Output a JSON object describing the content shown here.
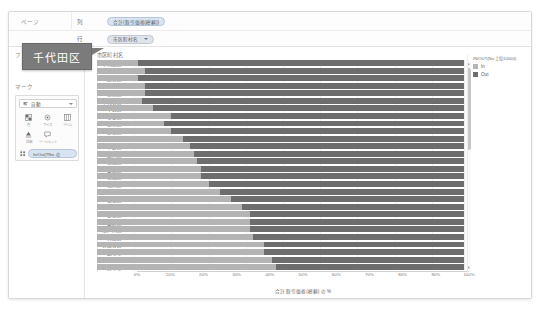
{
  "shelves": {
    "rows": [
      {
        "name": "ページ",
        "label": "列",
        "pill": "合計(取引価格(総額))",
        "has_caret": false
      },
      {
        "name": "",
        "label": "行",
        "pill": "市区町村名",
        "has_caret": true
      }
    ]
  },
  "sidebar": {
    "filters_header": "フ",
    "marks_header": "マーク",
    "marks_select": "自動",
    "marks_icon": "bar-mark-icon",
    "mark_buttons": [
      {
        "icon": "color-icon",
        "label": "色"
      },
      {
        "icon": "size-icon",
        "label": "サイズ"
      },
      {
        "icon": "label-icon",
        "label": "ラベル"
      },
      {
        "icon": "detail-icon",
        "label": "詳細"
      },
      {
        "icon": "tooltip-icon",
        "label": "ツールヒント"
      }
    ],
    "marks_pill": "In/Out(TNo. の"
  },
  "chart": {
    "row_header": "市区町村名",
    "legend": {
      "title": "IN/OUT(No.上位10000)",
      "items": [
        {
          "label": "In",
          "color": "#b4b4b4"
        },
        {
          "label": "Out",
          "color": "#6d6d6d"
        }
      ]
    },
    "scrollbar": {
      "up_arrow": "scroll-up-icon",
      "down_arrow": "scroll-down-icon"
    },
    "tooltip": {
      "text": "千代田区"
    }
  },
  "chart_data": {
    "type": "bar",
    "title": "",
    "subtitle": "",
    "xlabel": "合計 取引価格(総額) の %",
    "ylabel": "市区町村名",
    "orientation": "horizontal",
    "stacked": true,
    "normalized": true,
    "xlim": [
      0,
      100
    ],
    "xticks": [
      "0%",
      "10%",
      "20%",
      "30%",
      "40%",
      "50%",
      "60%",
      "70%",
      "80%",
      "90%",
      "100%"
    ],
    "grid": true,
    "legend_position": "right",
    "categories": [
      "千代田区",
      "港区",
      "渋谷区",
      "武蔵野市",
      "目黒区",
      "千代谷区",
      "中央区",
      "杉並区",
      "文京区",
      "新宿区",
      "豊島市",
      "中野区",
      "品川区",
      "台東区",
      "墨田区",
      "江東区",
      "荒川区",
      "北区",
      "板橋区",
      "練馬区",
      "足立区",
      "葛飾区",
      "江戸川区",
      "大田区",
      "世田谷区",
      "調布市",
      "三鷹市",
      "府中市"
    ],
    "series": [
      {
        "name": "In",
        "color": "#b4b4b4",
        "values": [
          11,
          13,
          11,
          13,
          13,
          12,
          15,
          20,
          18,
          20,
          23,
          25,
          26,
          27,
          28,
          28,
          30,
          33,
          36,
          39,
          41,
          41,
          41,
          42,
          45,
          45,
          47,
          48
        ]
      },
      {
        "name": "Out",
        "color": "#6d6d6d",
        "values": [
          89,
          87,
          89,
          87,
          87,
          88,
          85,
          80,
          82,
          80,
          77,
          75,
          74,
          73,
          72,
          72,
          70,
          67,
          64,
          61,
          59,
          59,
          59,
          58,
          55,
          55,
          53,
          52
        ]
      }
    ]
  }
}
